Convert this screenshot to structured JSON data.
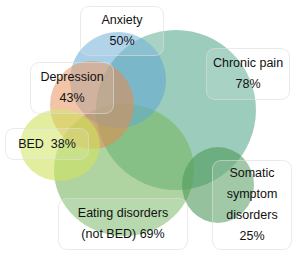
{
  "diagram": {
    "type": "venn",
    "sets": [
      {
        "id": "anxiety",
        "name": "Anxiety",
        "value": "50%",
        "color": "#5fa8d3"
      },
      {
        "id": "chronic_pain",
        "name": "Chronic pain",
        "value": "78%",
        "color": "#5fae93"
      },
      {
        "id": "depression",
        "name": "Depression",
        "value": "43%",
        "color": "#e8894a"
      },
      {
        "id": "bed",
        "name": "BED",
        "value": "38%",
        "color": "#c9df5a"
      },
      {
        "id": "eating_disorders",
        "name": "Eating disorders (not BED)",
        "value": "69%",
        "color": "#6fb25a"
      },
      {
        "id": "somatic",
        "name": "Somatic symptom disorders",
        "value": "25%",
        "color": "#4f9a5a"
      }
    ]
  },
  "labels": {
    "anxiety": {
      "line1": "Anxiety",
      "line2": "50%"
    },
    "depression": {
      "line1": "Depression",
      "line2": "43%"
    },
    "chronic_pain": {
      "line1": "Chronic pain",
      "line2": "78%"
    },
    "bed": {
      "line1": "BED  38%"
    },
    "eating_disorders": {
      "line1": "Eating disorders",
      "line2": "(not BED) 69%"
    },
    "somatic": {
      "line1": "Somatic",
      "line2": "symptom",
      "line3": "disorders",
      "line4": "25%"
    }
  }
}
